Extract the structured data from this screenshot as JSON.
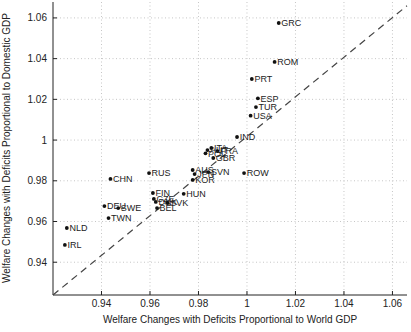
{
  "figure": {
    "background": "#ffffff",
    "axis_color": "#222222",
    "grid_color": "#c6c6c6",
    "point_color": "#111111",
    "point_label_color": "#222222",
    "dashed_line_color": "#444444",
    "tick_label_color": "#222222"
  },
  "chart_data": {
    "type": "scatter",
    "title": "",
    "xlabel": "Welfare Changes with Deficits Proportional to World GDP",
    "ylabel": "Welfare Changes with Deficits Proportional to Domestic GDP",
    "xlim": [
      0.92,
      1.066
    ],
    "ylim": [
      0.9239,
      1.0688
    ],
    "grid": true,
    "grid_style": "dotted",
    "xticks": [
      0.94,
      0.96,
      0.98,
      1,
      1.02,
      1.04,
      1.06
    ],
    "xtick_labels": [
      "0.94",
      "0.96",
      "0.98",
      "1",
      "1.02",
      "1.04",
      "1.06"
    ],
    "yticks": [
      0.94,
      0.96,
      0.98,
      1,
      1.02,
      1.04,
      1.06
    ],
    "ytick_labels": [
      "0.94",
      "0.96",
      "0.98",
      "1",
      "1.02",
      "1.04",
      "1.06"
    ],
    "reference_line": {
      "description": "45-degree identity dashed line",
      "style": "dashed",
      "from": [
        0.92,
        0.92
      ],
      "to": [
        1.066,
        1.066
      ]
    },
    "marker": "dot",
    "points": [
      {
        "label": "GRC",
        "x": 1.0131,
        "y": 1.0575
      },
      {
        "label": "ROM",
        "x": 1.0114,
        "y": 1.0384
      },
      {
        "label": "PRT",
        "x": 1.002,
        "y": 1.03
      },
      {
        "label": "ESP",
        "x": 1.0045,
        "y": 1.0205
      },
      {
        "label": "TUR",
        "x": 1.0037,
        "y": 1.0162
      },
      {
        "label": "USA",
        "x": 1.0015,
        "y": 1.012
      },
      {
        "label": "IND",
        "x": 0.9959,
        "y": 1.0015
      },
      {
        "label": "ITA",
        "x": 0.9853,
        "y": 0.9961
      },
      {
        "label": "AUT",
        "x": 0.9837,
        "y": 0.9951
      },
      {
        "label": "FRA",
        "x": 0.9878,
        "y": 0.9946
      },
      {
        "label": "POL",
        "x": 0.9829,
        "y": 0.9935
      },
      {
        "label": "GBR",
        "x": 0.9861,
        "y": 0.9912
      },
      {
        "label": "AUS",
        "x": 0.9776,
        "y": 0.9853
      },
      {
        "label": "SVN",
        "x": 0.9841,
        "y": 0.9843
      },
      {
        "label": "ROW",
        "x": 0.9988,
        "y": 0.9838
      },
      {
        "label": "RUS",
        "x": 0.9596,
        "y": 0.9838
      },
      {
        "label": "JPN",
        "x": 0.9784,
        "y": 0.9833
      },
      {
        "label": "CHN",
        "x": 0.9437,
        "y": 0.9809
      },
      {
        "label": "KOR",
        "x": 0.9776,
        "y": 0.9804
      },
      {
        "label": "FIN",
        "x": 0.9612,
        "y": 0.974
      },
      {
        "label": "HUN",
        "x": 0.9739,
        "y": 0.9736
      },
      {
        "label": "CZE",
        "x": 0.9616,
        "y": 0.9711
      },
      {
        "label": "DNK",
        "x": 0.9624,
        "y": 0.9696
      },
      {
        "label": "SVK",
        "x": 0.9673,
        "y": 0.9691
      },
      {
        "label": "DEU",
        "x": 0.9412,
        "y": 0.9676
      },
      {
        "label": "SWE",
        "x": 0.9469,
        "y": 0.9666
      },
      {
        "label": "BEL",
        "x": 0.9629,
        "y": 0.9666
      },
      {
        "label": "TWN",
        "x": 0.9429,
        "y": 0.9617
      },
      {
        "label": "NLD",
        "x": 0.9257,
        "y": 0.9568
      },
      {
        "label": "IRL",
        "x": 0.9249,
        "y": 0.9485
      }
    ]
  }
}
